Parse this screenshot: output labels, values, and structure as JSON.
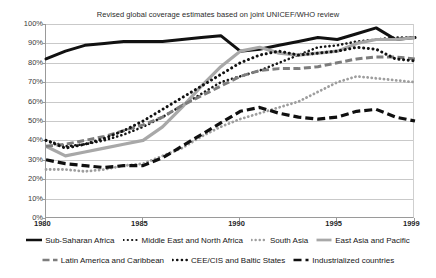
{
  "chart_data": {
    "type": "line",
    "title": "Revised global coverage estimates based on joint UNICEF/WHO review",
    "xlabel": "",
    "ylabel": "",
    "xlim": [
      1980,
      1999
    ],
    "ylim": [
      0,
      100
    ],
    "grid": true,
    "legend_position": "bottom",
    "x": [
      1980,
      1981,
      1982,
      1983,
      1984,
      1985,
      1986,
      1987,
      1988,
      1989,
      1990,
      1991,
      1992,
      1993,
      1994,
      1995,
      1996,
      1997,
      1998,
      1999
    ],
    "xticks": [
      "1980",
      "1985",
      "1990",
      "1995",
      "1999"
    ],
    "yticks": [
      "0%",
      "10%",
      "20%",
      "30%",
      "40%",
      "50%",
      "60%",
      "70%",
      "80%",
      "90%",
      "100%"
    ],
    "series": [
      {
        "name": "Sub-Saharan Africa",
        "style": "solid-thick-black",
        "color": "#111111",
        "values": [
          82,
          86,
          89,
          90,
          91,
          91,
          91,
          92,
          93,
          94,
          86,
          87,
          89,
          91,
          93,
          92,
          95,
          98,
          92,
          93
        ]
      },
      {
        "name": "Middle East and North Africa",
        "style": "dotted-black",
        "color": "#161616",
        "values": [
          40,
          37,
          38,
          40,
          43,
          47,
          52,
          58,
          64,
          70,
          73,
          76,
          80,
          84,
          88,
          89,
          91,
          92,
          93,
          93
        ]
      },
      {
        "name": "South Asia",
        "style": "dotted-gray",
        "color": "#9e9e9e",
        "values": [
          25,
          25,
          24,
          25,
          27,
          28,
          32,
          36,
          42,
          47,
          51,
          54,
          57,
          60,
          65,
          70,
          73,
          72,
          71,
          70
        ]
      },
      {
        "name": "East Asia and Pacific",
        "style": "solid-thick-gray",
        "color": "#a8a8a8",
        "values": [
          37,
          32,
          34,
          36,
          38,
          40,
          47,
          57,
          68,
          78,
          86,
          88,
          85,
          84,
          85,
          86,
          90,
          92,
          92,
          93
        ]
      },
      {
        "name": "Latin America and Caribbean",
        "style": "dashed-gray",
        "color": "#7d7d7d",
        "values": [
          37,
          38,
          40,
          42,
          45,
          48,
          52,
          58,
          63,
          68,
          73,
          76,
          77,
          77,
          78,
          80,
          82,
          83,
          83,
          82
        ]
      },
      {
        "name": "CEE/CIS and Baltic States",
        "style": "dotted-black-large",
        "color": "#111111",
        "values": [
          40,
          36,
          38,
          41,
          45,
          50,
          56,
          62,
          68,
          74,
          80,
          84,
          86,
          84,
          85,
          86,
          88,
          87,
          82,
          81
        ]
      },
      {
        "name": "Industrialized countries",
        "style": "dashed-thick-black",
        "color": "#101010",
        "values": [
          30,
          28,
          27,
          26,
          27,
          27,
          31,
          37,
          43,
          49,
          55,
          57,
          54,
          52,
          51,
          52,
          55,
          56,
          52,
          50
        ]
      }
    ]
  },
  "legend": {
    "rows": [
      [
        {
          "label": "Sub-Saharan Africa",
          "series": 0
        },
        {
          "label": "Middle East and North Africa",
          "series": 1
        },
        {
          "label": "South Asia",
          "series": 2
        },
        {
          "label": "East Asia and Pacific",
          "series": 3
        }
      ],
      [
        {
          "label": "Latin America and Caribbean",
          "series": 4
        },
        {
          "label": "CEE/CIS and Baltic States",
          "series": 5
        },
        {
          "label": "Industrialized countries",
          "series": 6
        }
      ]
    ]
  }
}
